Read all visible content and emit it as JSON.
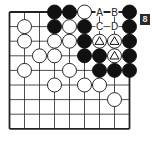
{
  "diagram": {
    "label": "8",
    "grid": {
      "cols": 9,
      "rows": 9,
      "x0": 9.5,
      "y0": 12,
      "dx": 15,
      "dy": 14.6
    },
    "colors": {
      "black": "#111111",
      "white": "#ffffff",
      "line": "#222222"
    },
    "stones": [
      {
        "c": 3,
        "r": 0,
        "color": "black"
      },
      {
        "c": 4,
        "r": 0,
        "color": "black"
      },
      {
        "c": 5,
        "r": 0,
        "color": "white"
      },
      {
        "c": 8,
        "r": 0,
        "color": "black"
      },
      {
        "c": 1,
        "r": 1,
        "color": "white"
      },
      {
        "c": 3,
        "r": 1,
        "color": "black"
      },
      {
        "c": 4,
        "r": 1,
        "color": "white"
      },
      {
        "c": 5,
        "r": 1,
        "color": "black"
      },
      {
        "c": 8,
        "r": 1,
        "color": "black"
      },
      {
        "c": 1,
        "r": 2,
        "color": "white"
      },
      {
        "c": 3,
        "r": 2,
        "color": "white"
      },
      {
        "c": 4,
        "r": 2,
        "color": "white"
      },
      {
        "c": 5,
        "r": 2,
        "color": "black"
      },
      {
        "c": 6,
        "r": 2,
        "color": "white",
        "mark": "triangle"
      },
      {
        "c": 7,
        "r": 2,
        "color": "white",
        "mark": "triangle"
      },
      {
        "c": 8,
        "r": 2,
        "color": "black"
      },
      {
        "c": 2,
        "r": 3,
        "color": "white"
      },
      {
        "c": 3,
        "r": 3,
        "color": "white"
      },
      {
        "c": 5,
        "r": 3,
        "color": "black"
      },
      {
        "c": 6,
        "r": 3,
        "color": "black"
      },
      {
        "c": 7,
        "r": 3,
        "color": "white",
        "mark": "triangle"
      },
      {
        "c": 8,
        "r": 3,
        "color": "black"
      },
      {
        "c": 1,
        "r": 4,
        "color": "white"
      },
      {
        "c": 4,
        "r": 4,
        "color": "white"
      },
      {
        "c": 6,
        "r": 4,
        "color": "black"
      },
      {
        "c": 7,
        "r": 4,
        "color": "black"
      },
      {
        "c": 8,
        "r": 4,
        "color": "black"
      },
      {
        "c": 3,
        "r": 5,
        "color": "white"
      },
      {
        "c": 5,
        "r": 5,
        "color": "white"
      },
      {
        "c": 6,
        "r": 5,
        "color": "white"
      },
      {
        "c": 7,
        "r": 6,
        "color": "white"
      }
    ],
    "letters": [
      {
        "c": 6,
        "r": 0,
        "text": "A"
      },
      {
        "c": 7,
        "r": 0,
        "text": "B"
      },
      {
        "c": 6,
        "r": 1,
        "text": "C"
      },
      {
        "c": 7,
        "r": 1,
        "text": "D"
      }
    ]
  }
}
